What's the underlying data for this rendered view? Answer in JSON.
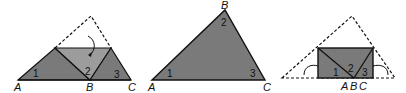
{
  "diagram": {
    "colors": {
      "dark_fill": "#7a7a7a",
      "light_fill": "#9c9c9c",
      "stroke": "#111111",
      "background": "#ffffff"
    },
    "figures": [
      {
        "id": "fold-step",
        "vertices": {
          "A": "A",
          "B": "B",
          "C": "C"
        },
        "angles": [
          "1",
          "2",
          "3"
        ]
      },
      {
        "id": "original-triangle",
        "vertices": {
          "A": "A",
          "B": "B",
          "C": "C"
        },
        "angles": [
          "1",
          "2",
          "3"
        ]
      },
      {
        "id": "folded-rectangle",
        "vertices": {
          "A": "A",
          "B": "B",
          "C": "C"
        },
        "angles": [
          "1",
          "2",
          "3"
        ]
      }
    ]
  }
}
